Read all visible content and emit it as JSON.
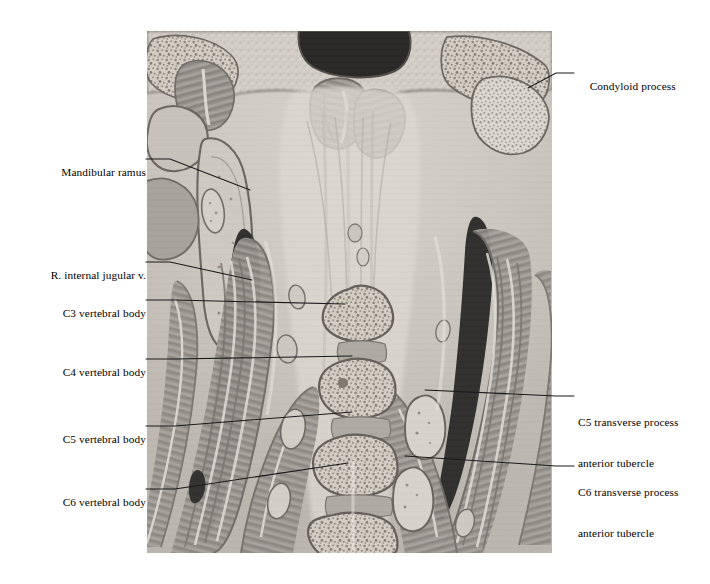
{
  "figure": {
    "kind": "anatomical-cross-section",
    "region": "coronal section of neck and cervical spine",
    "modality": "grayscale cryosection plate",
    "image_area": {
      "x": 147,
      "y": 31,
      "width": 405,
      "height": 522
    },
    "background_color": "#ffffff",
    "leader_line_color": "#1a1a1a",
    "palette": {
      "bone_fill": "#cfc9c0",
      "bone_outline": "#6b655f",
      "muscle_mid": "#8f8b86",
      "muscle_dark": "#6e6a66",
      "muscle_light": "#b3afa9",
      "fascia_light": "#ded9d2",
      "vessel_black": "#141414",
      "airway_black": "#0a0a0a",
      "marrow_speckle": "#7d766c"
    }
  },
  "labels": {
    "left": [
      {
        "id": "mandibular-ramus",
        "text": "Mandibular ramus",
        "text_x": 140,
        "text_y": 159,
        "leader": [
          [
            146,
            159
          ],
          [
            170,
            159
          ],
          [
            250,
            190
          ]
        ]
      },
      {
        "id": "r-internal-jugular-vein",
        "text": "R. internal jugular v.",
        "text_x": 140,
        "text_y": 262,
        "leader": [
          [
            146,
            262
          ],
          [
            170,
            262
          ],
          [
            252,
            280
          ]
        ]
      },
      {
        "id": "c3-vertebral-body",
        "text": "C3 vertebral body",
        "text_x": 140,
        "text_y": 300,
        "leader": [
          [
            146,
            300
          ],
          [
            175,
            300
          ],
          [
            345,
            304
          ]
        ]
      },
      {
        "id": "c4-vertebral-body",
        "text": "C4 vertebral body",
        "text_x": 140,
        "text_y": 359,
        "leader": [
          [
            146,
            359
          ],
          [
            175,
            359
          ],
          [
            352,
            356
          ]
        ]
      },
      {
        "id": "c5-vertebral-body",
        "text": "C5 vertebral body",
        "text_x": 140,
        "text_y": 426,
        "leader": [
          [
            146,
            426
          ],
          [
            175,
            426
          ],
          [
            352,
            412
          ]
        ]
      },
      {
        "id": "c6-vertebral-body",
        "text": "C6 vertebral body",
        "text_x": 140,
        "text_y": 489,
        "leader": [
          [
            146,
            489
          ],
          [
            175,
            489
          ],
          [
            348,
            463
          ]
        ]
      }
    ],
    "right": [
      {
        "id": "condyloid-process",
        "text": "Condyloid process",
        "text_x": 578,
        "text_y": 73,
        "leader": [
          [
            574,
            73
          ],
          [
            556,
            73
          ],
          [
            528,
            88
          ]
        ]
      },
      {
        "id": "c5-transverse-process-anterior-tubercle",
        "text_line1": "C5 transverse process",
        "text_line2": "anterior tubercle",
        "text_x": 578,
        "text_y": 396,
        "leader": [
          [
            574,
            396
          ],
          [
            556,
            396
          ],
          [
            425,
            390
          ]
        ]
      },
      {
        "id": "c6-transverse-process-anterior-tubercle",
        "text_line1": "C6 transverse process",
        "text_line2": "anterior tubercle",
        "text_x": 578,
        "text_y": 466,
        "leader": [
          [
            574,
            466
          ],
          [
            556,
            466
          ],
          [
            405,
            456
          ]
        ]
      }
    ]
  },
  "structures": [
    {
      "name": "airway-nasopharynx-cavity",
      "tone": "#0a0a0a"
    },
    {
      "name": "left-internal-jugular-vein",
      "tone": "#141414"
    },
    {
      "name": "right-internal-jugular-vein",
      "tone": "#141414"
    },
    {
      "name": "c3-vertebral-body",
      "tone": "#cfc9c0"
    },
    {
      "name": "c4-vertebral-body",
      "tone": "#cfc9c0"
    },
    {
      "name": "c5-vertebral-body",
      "tone": "#cfc9c0"
    },
    {
      "name": "c6-vertebral-body",
      "tone": "#cfc9c0"
    },
    {
      "name": "c5-anterior-tubercle",
      "tone": "#cfc9c0"
    },
    {
      "name": "c6-anterior-tubercle",
      "tone": "#cfc9c0"
    },
    {
      "name": "mandibular-ramus-bone",
      "tone": "#d6d1c8"
    },
    {
      "name": "condyloid-process-bone",
      "tone": "#d6d1c8"
    },
    {
      "name": "sternocleidomastoid-muscle",
      "tone": "#8f8b86"
    },
    {
      "name": "scalene-muscle-group",
      "tone": "#8f8b86"
    },
    {
      "name": "longus-colli-muscle",
      "tone": "#9b9792"
    }
  ]
}
